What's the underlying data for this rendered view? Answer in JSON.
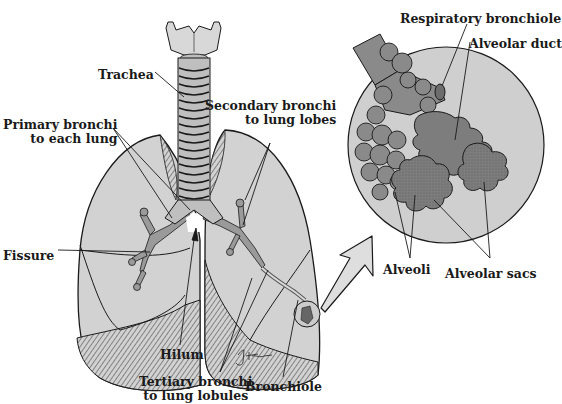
{
  "diagram": {
    "colors": {
      "lung_fill": "#d2d2d2",
      "lung_stroke": "#1a1a1a",
      "alveoli_fill": "#7a7a7a",
      "inset_circle_fill": "#cfcfcf",
      "background": "#ffffff"
    },
    "labels": {
      "trachea": "Trachea",
      "primary_bronchi": [
        "Primary bronchi",
        "to each lung"
      ],
      "secondary_bronchi": [
        "Secondary bronchi",
        "to lung lobes"
      ],
      "fissure": "Fissure",
      "hilum": "Hilum",
      "tertiary_bronchi": [
        "Tertiary bronchi",
        "to lung lobules"
      ],
      "bronchiole": "Bronchiole",
      "respiratory_bronchiole": "Respiratory bronchiole",
      "alveolar_duct": "Alveolar duct",
      "alveoli": "Alveoli",
      "alveolar_sacs": "Alveolar sacs",
      "signature": "J Fultz"
    }
  }
}
